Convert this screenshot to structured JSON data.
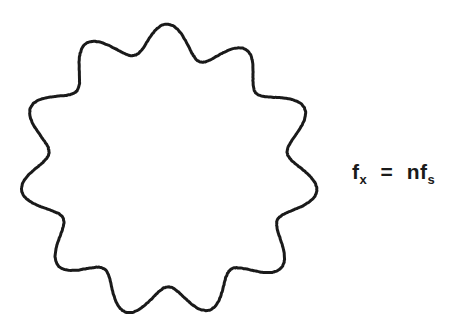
{
  "figure": {
    "background_color": "#ffffff",
    "stroke_color": "#1a1a1a",
    "stroke_width": 3,
    "caption_present": false
  },
  "shape": {
    "name": "sinusoidally-modulated-circle",
    "description": "Closed wavy circular outline with eleven rounded lobes, hand-drawn appearance",
    "lobe_count": 11,
    "center_x": 168,
    "center_y": 170,
    "outer_radius": 148,
    "inner_radius": 118,
    "mean_radius": 133,
    "amplitude": 15,
    "phase_degrees": -90
  },
  "equation": {
    "full_text": "fx = nfs",
    "left": {
      "base": "f",
      "subscript": "x"
    },
    "operator": "=",
    "right": {
      "coefficient": "n",
      "base": "f",
      "subscript": "s"
    },
    "color": "#1a1a1a"
  },
  "chart_data": {
    "type": "line",
    "title": "",
    "xlabel": "",
    "ylabel": "",
    "polar": {
      "mean_radius": 133,
      "amplitude": 15,
      "harmonic_number": 11,
      "theta_range_degrees": [
        0,
        360
      ],
      "radius_min": 118,
      "radius_max": 148
    },
    "annotations": [
      "fx = nfs"
    ],
    "grid": false,
    "legend": false
  }
}
